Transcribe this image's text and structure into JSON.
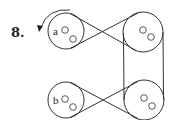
{
  "problem": {
    "number": "8.",
    "rotation_arrow": "counterclockwise-arrow"
  },
  "pulleys": [
    {
      "id": "a",
      "label": "a",
      "cx": 66,
      "cy": 31,
      "r": 18
    },
    {
      "id": "top-right",
      "label": "",
      "cx": 143,
      "cy": 32,
      "r": 20
    },
    {
      "id": "b",
      "label": "b",
      "cx": 66,
      "cy": 100,
      "r": 18
    },
    {
      "id": "bottom-right",
      "label": "",
      "cx": 144,
      "cy": 100,
      "r": 20
    }
  ],
  "belts": [
    {
      "from": "a",
      "to": "top-right",
      "type": "crossed"
    },
    {
      "from": "top-right",
      "to": "bottom-right",
      "type": "open"
    },
    {
      "from": "b",
      "to": "bottom-right",
      "type": "crossed"
    }
  ],
  "colors": {
    "line": "#333333",
    "background": "#ffffff"
  }
}
